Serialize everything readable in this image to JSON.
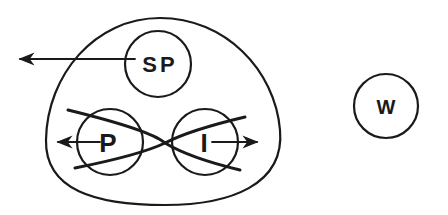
{
  "diagram": {
    "nodes": {
      "sp": {
        "label": "SP",
        "cx": 158,
        "cy": 64,
        "r": 33
      },
      "p": {
        "label": "P",
        "cx": 110,
        "cy": 142,
        "r": 33
      },
      "i": {
        "label": "I",
        "cx": 205,
        "cy": 142,
        "r": 33
      },
      "w": {
        "label": "W",
        "cx": 386,
        "cy": 106,
        "r": 32
      }
    },
    "colors": {
      "stroke": "#1a1a1a",
      "background": "#ffffff"
    }
  }
}
